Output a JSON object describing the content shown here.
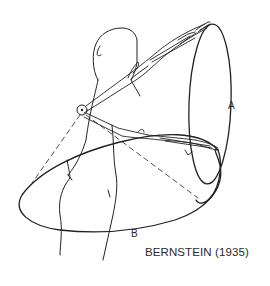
{
  "diagram": {
    "caption": "BERNSTEIN (1935)",
    "labels": {
      "trajectory_a": "A",
      "trajectory_b": "B"
    },
    "elements": [
      "human-figure",
      "shoulder-joint",
      "raised-arm",
      "lowered-arm",
      "ellipse-a",
      "ellipse-b",
      "dashed-projection-lines"
    ],
    "colors": {
      "line": "#222222",
      "background": "#ffffff"
    }
  }
}
